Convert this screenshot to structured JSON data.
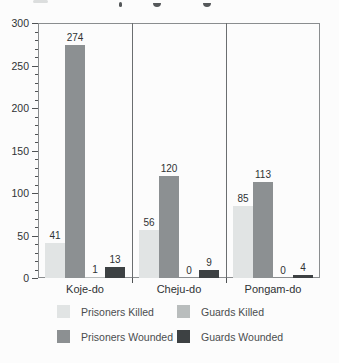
{
  "chart_data": {
    "type": "bar",
    "categories": [
      "Koje-do",
      "Cheju-do",
      "Pongam-do"
    ],
    "series": [
      {
        "name": "Prisoners Killed",
        "color": "#e1e4e4",
        "values": [
          41,
          56,
          85
        ]
      },
      {
        "name": "Prisoners Wounded",
        "color": "#8c9092",
        "values": [
          274,
          120,
          113
        ]
      },
      {
        "name": "Guards Killed",
        "color": "#b9bdbd",
        "values": [
          1,
          0,
          0
        ]
      },
      {
        "name": "Guards Wounded",
        "color": "#3d4143",
        "values": [
          13,
          9,
          4
        ]
      }
    ],
    "title": "",
    "xlabel": "",
    "ylabel": "",
    "ylim": [
      0,
      300
    ],
    "y_ticks": [
      0,
      50,
      100,
      150,
      200,
      250,
      300
    ],
    "y_minor_step": 10,
    "grid": false,
    "bar_value_labels": true,
    "legend_position": "bottom"
  },
  "legend": {
    "items": [
      {
        "label": "Prisoners Killed",
        "color": "#e1e4e4"
      },
      {
        "label": "Prisoners Wounded",
        "color": "#8c9092"
      },
      {
        "label": "Guards Killed",
        "color": "#b9bdbd"
      },
      {
        "label": "Guards Wounded",
        "color": "#3d4143"
      }
    ]
  },
  "colors": {
    "background": "#fcfcfc",
    "plot_border": "#8a8d8f",
    "group_separator": "#6b6e70",
    "tick": "#4f5254",
    "axis_text": "#2f3234",
    "legend_text": "#4a4d4f"
  }
}
